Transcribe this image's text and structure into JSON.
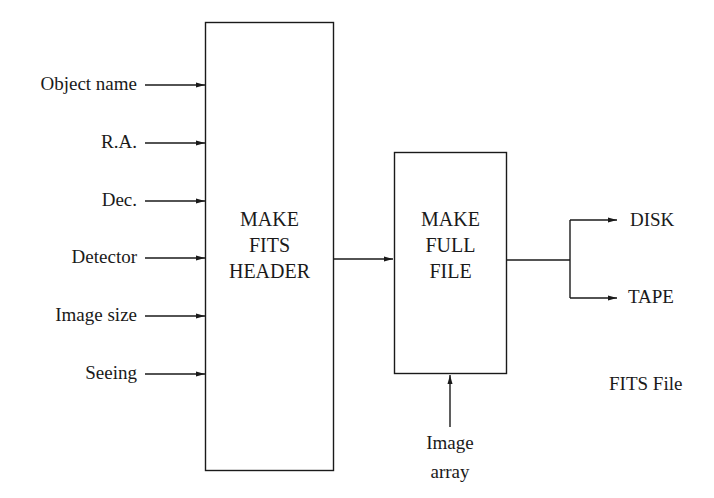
{
  "diagram": {
    "inputs": [
      {
        "label": "Object name"
      },
      {
        "label": "R.A."
      },
      {
        "label": "Dec."
      },
      {
        "label": "Detector"
      },
      {
        "label": "Image size"
      },
      {
        "label": "Seeing"
      }
    ],
    "boxes": {
      "header": {
        "line1": "MAKE",
        "line2": "FITS",
        "line3": "HEADER"
      },
      "full_file": {
        "line1": "MAKE",
        "line2": "FULL",
        "line3": "FILE"
      }
    },
    "image_input": {
      "line1": "Image",
      "line2": "array"
    },
    "outputs": [
      {
        "label": "DISK"
      },
      {
        "label": "TAPE"
      }
    ],
    "caption": "FITS File",
    "line_color": "#1a1a1a"
  }
}
